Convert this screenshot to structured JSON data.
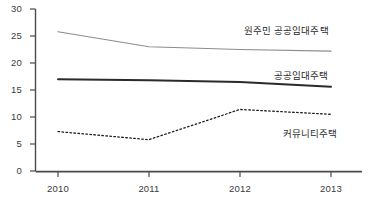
{
  "chart_data": {
    "type": "line",
    "title": "",
    "subtitle": "",
    "xlabel": "",
    "ylabel": "",
    "categories": [
      "2010",
      "2011",
      "2012",
      "2013"
    ],
    "x": [
      2010,
      2011,
      2012,
      2013
    ],
    "xlim": [
      2009.7,
      2013.3
    ],
    "ylim": [
      0,
      30
    ],
    "yticks": [
      0,
      5,
      10,
      15,
      20,
      25,
      30
    ],
    "ytick_labels": [
      "0",
      "5",
      "10",
      "15",
      "20",
      "25",
      "30"
    ],
    "xtick_labels": [
      "2010",
      "2011",
      "2012",
      "2013"
    ],
    "grid": false,
    "legend_position": "inline-right",
    "series": [
      {
        "name": "원주민 공공임대주택",
        "values": [
          25.8,
          23.0,
          22.5,
          22.2
        ],
        "style": "solid-thin",
        "color": "#8c8c8c",
        "width": 1.1,
        "label_x": 244,
        "label_y": 25
      },
      {
        "name": "공공임대주택",
        "values": [
          17.0,
          16.8,
          16.5,
          15.6
        ],
        "style": "solid-thick",
        "color": "#2b2b2b",
        "width": 2.0,
        "label_x": 274,
        "label_y": 70
      },
      {
        "name": "커뮤니티주택",
        "values": [
          7.3,
          5.8,
          11.4,
          10.5
        ],
        "style": "dotted",
        "color": "#1f1f1f",
        "width": 1.3,
        "label_x": 283,
        "label_y": 128
      }
    ],
    "axis_color": "#4a4a4a",
    "text_color": "#3a3a3a",
    "background": "#ffffff"
  }
}
